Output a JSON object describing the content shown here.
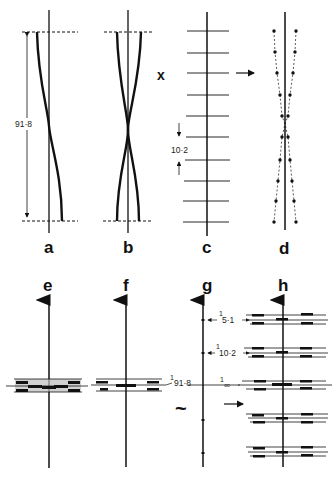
{
  "panels": {
    "a": {
      "label": "a",
      "dimension": "91·8"
    },
    "b": {
      "label": "b"
    },
    "c": {
      "label": "c",
      "spacing": "10·2",
      "cross_symbol": "x"
    },
    "d": {
      "label": "d"
    },
    "e": {
      "label": "e"
    },
    "f": {
      "label": "f",
      "layer_line": "91·8",
      "layer_num": "1"
    },
    "g": {
      "label": "g",
      "tilde": "~",
      "layer_lines": [
        {
          "num": "1",
          "den": "5·1"
        },
        {
          "num": "1",
          "den": "10·2"
        },
        {
          "num": "1",
          "den": "∞"
        }
      ]
    },
    "h": {
      "label": "h"
    }
  },
  "colors": {
    "ink": "#111111",
    "background": "#ffffff"
  }
}
